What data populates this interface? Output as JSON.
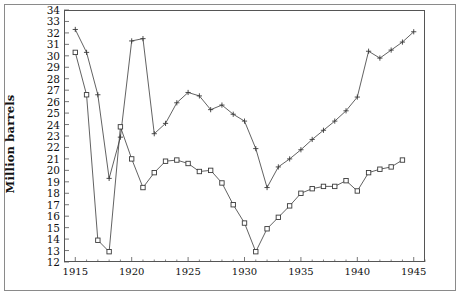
{
  "figure": {
    "background": "#ffffff",
    "frame_color": "#8a8a8a",
    "axis_color": "#555555",
    "series_color": "#3a3a3a"
  },
  "chart_data": {
    "type": "line",
    "title": "",
    "subtitle": "",
    "xlabel": "",
    "ylabel": "Million barrels",
    "xlim": [
      1914,
      1946
    ],
    "ylim": [
      12,
      34
    ],
    "grid": false,
    "legend": "none",
    "y_ticks": [
      12,
      13,
      14,
      15,
      16,
      17,
      18,
      19,
      20,
      21,
      22,
      23,
      24,
      25,
      26,
      27,
      28,
      29,
      30,
      31,
      32,
      33,
      34
    ],
    "y_tick_labels": [
      "12",
      "13",
      "14",
      "15",
      "16",
      "17",
      "18",
      "19",
      "20",
      "21",
      "22",
      "23",
      "24",
      "25",
      "26",
      "27",
      "28",
      "29",
      "30",
      "31",
      "32",
      "33",
      "34"
    ],
    "x_ticks": [
      1915,
      1920,
      1925,
      1930,
      1935,
      1940,
      1945
    ],
    "x_tick_labels": [
      "1915",
      "1920",
      "1925",
      "1930",
      "1935",
      "1940",
      "1945"
    ],
    "x_minor_ticks": [
      1916,
      1917,
      1918,
      1919,
      1921,
      1922,
      1923,
      1924,
      1926,
      1927,
      1928,
      1929,
      1931,
      1932,
      1933,
      1934,
      1936,
      1937,
      1938,
      1939,
      1941,
      1942,
      1943,
      1944,
      1946
    ],
    "series": [
      {
        "name": "series-plus",
        "marker": "plus",
        "x": [
          1915,
          1916,
          1917,
          1918,
          1919,
          1920,
          1921,
          1922,
          1923,
          1924,
          1925,
          1926,
          1927,
          1928,
          1929,
          1930,
          1931,
          1932,
          1933,
          1934,
          1935,
          1936,
          1937,
          1938,
          1939,
          1940,
          1941,
          1942,
          1943,
          1944,
          1945
        ],
        "values": [
          32.3,
          30.3,
          26.6,
          19.3,
          22.9,
          31.3,
          31.5,
          23.2,
          24.1,
          25.9,
          26.8,
          26.5,
          25.3,
          25.7,
          24.9,
          24.3,
          21.9,
          18.5,
          20.3,
          21.0,
          21.8,
          22.7,
          23.5,
          24.3,
          25.2,
          26.4,
          30.4,
          29.8,
          30.5,
          31.2,
          32.1
        ]
      },
      {
        "name": "series-square",
        "marker": "square",
        "x": [
          1915,
          1916,
          1917,
          1918,
          1919,
          1920,
          1921,
          1922,
          1923,
          1924,
          1925,
          1926,
          1927,
          1928,
          1929,
          1930,
          1931,
          1932,
          1933,
          1934,
          1935,
          1936,
          1937,
          1938,
          1939,
          1940,
          1941,
          1942,
          1943,
          1944
        ],
        "values": [
          30.3,
          26.6,
          13.9,
          12.9,
          23.8,
          21.0,
          18.5,
          19.8,
          20.8,
          20.9,
          20.6,
          19.9,
          20.0,
          18.9,
          17.0,
          15.4,
          12.9,
          14.9,
          15.9,
          16.9,
          18.0,
          18.4,
          18.6,
          18.6,
          19.1,
          18.2,
          19.8,
          20.1,
          20.3,
          20.9
        ]
      }
    ]
  }
}
